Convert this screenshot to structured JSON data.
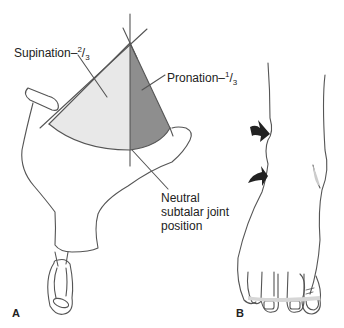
{
  "figure": {
    "panel_a": {
      "label": "A",
      "supination_label": "Supination–",
      "supination_fraction_num": "2",
      "supination_fraction_den": "3",
      "pronation_label": "Pronation–",
      "pronation_fraction_num": "1",
      "pronation_fraction_den": "3",
      "neutral_label_line1": "Neutral",
      "neutral_label_line2": "subtalar joint",
      "neutral_label_line3": "position"
    },
    "panel_b": {
      "label": "B",
      "arrow_count": 2
    },
    "colors": {
      "line": "#555555",
      "supination_fill": "#e6e6e6",
      "pronation_fill": "#8e8e8e",
      "arrow_fill": "#222222"
    }
  }
}
